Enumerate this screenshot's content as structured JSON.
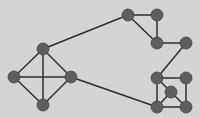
{
  "diagram": {
    "type": "graph",
    "background": "#d4d4d4",
    "node_color": "#5e5e5e",
    "node_stroke": "#444444",
    "edge_color": "#2e2e2e",
    "node_radius": 6,
    "nodes": [
      {
        "id": "L_top",
        "x": 43,
        "y": 49
      },
      {
        "id": "L_left",
        "x": 14,
        "y": 77
      },
      {
        "id": "L_right",
        "x": 71,
        "y": 77
      },
      {
        "id": "L_bottom",
        "x": 43,
        "y": 105
      },
      {
        "id": "A",
        "x": 128,
        "y": 15
      },
      {
        "id": "B",
        "x": 157,
        "y": 15
      },
      {
        "id": "C",
        "x": 157,
        "y": 43
      },
      {
        "id": "D",
        "x": 186,
        "y": 43
      },
      {
        "id": "E",
        "x": 157,
        "y": 78
      },
      {
        "id": "F",
        "x": 186,
        "y": 78
      },
      {
        "id": "G",
        "x": 171,
        "y": 92
      },
      {
        "id": "H",
        "x": 157,
        "y": 107
      },
      {
        "id": "I",
        "x": 186,
        "y": 107
      }
    ],
    "edges": [
      [
        "L_top",
        "L_left"
      ],
      [
        "L_top",
        "L_right"
      ],
      [
        "L_top",
        "L_bottom"
      ],
      [
        "L_left",
        "L_right"
      ],
      [
        "L_left",
        "L_bottom"
      ],
      [
        "L_right",
        "L_bottom"
      ],
      [
        "L_top",
        "A"
      ],
      [
        "L_right",
        "H"
      ],
      [
        "A",
        "B"
      ],
      [
        "A",
        "C"
      ],
      [
        "B",
        "C"
      ],
      [
        "C",
        "D"
      ],
      [
        "D",
        "E"
      ],
      [
        "E",
        "F"
      ],
      [
        "E",
        "H"
      ],
      [
        "F",
        "I"
      ],
      [
        "H",
        "I"
      ],
      [
        "E",
        "G"
      ],
      [
        "G",
        "H"
      ],
      [
        "G",
        "I"
      ]
    ]
  }
}
